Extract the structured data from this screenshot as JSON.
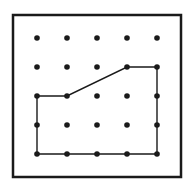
{
  "diagram": {
    "type": "geoboard",
    "frame": {
      "x": 13,
      "y": 15,
      "width": 168,
      "height": 162,
      "stroke": "#1a1a1a",
      "stroke_width": 2.5
    },
    "grid": {
      "cols": 5,
      "rows": 5,
      "x": [
        37,
        67,
        97,
        127,
        157
      ],
      "y": [
        38,
        67,
        96,
        125,
        154
      ],
      "dot_radius": 2.8,
      "dot_color": "#1a1a1a"
    },
    "polygon": {
      "vertices": [
        [
          0,
          2
        ],
        [
          1,
          2
        ],
        [
          3,
          1
        ],
        [
          4,
          1
        ],
        [
          4,
          4
        ],
        [
          0,
          4
        ]
      ],
      "stroke": "#1a1a1a",
      "stroke_width": 1.4
    }
  }
}
